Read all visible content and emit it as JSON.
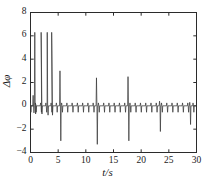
{
  "figure": {
    "background_color": "#ffffff",
    "line_color": "#3a3a3a",
    "axis_color": "#2b2b2b"
  },
  "axes": {
    "x_label": "t/s",
    "y_label": "Δφ",
    "x_ticks": [
      "0",
      "5",
      "10",
      "15",
      "20",
      "25",
      "30"
    ],
    "y_ticks": [
      "8",
      "6",
      "4",
      "2",
      "0",
      "−2",
      "−4"
    ]
  },
  "chart_data": {
    "type": "line",
    "title": "",
    "xlabel": "t/s",
    "ylabel": "Δφ",
    "xlim": [
      0,
      30
    ],
    "ylim": [
      -4,
      8
    ],
    "x_ticks": [
      0,
      5,
      10,
      15,
      20,
      25,
      30
    ],
    "y_ticks": [
      8,
      6,
      4,
      2,
      0,
      -2,
      -4
    ],
    "grid": false,
    "legend": "none",
    "series": [
      {
        "name": "phase difference",
        "description": "Near-zero baseline with periodic narrow downward spikes (~0.95 s period) and a set of large isolated transients.",
        "baseline_value": 0.0,
        "baseline_spike_period": 0.95,
        "baseline_spike_depth": -0.55,
        "baseline_spike_rise": 0.25,
        "transients": [
          {
            "t": 0.55,
            "up": 0.9,
            "down": -0.6
          },
          {
            "t": 0.85,
            "up": 6.3,
            "down": -0.7
          },
          {
            "t": 2.0,
            "up": 6.3,
            "down": -0.7
          },
          {
            "t": 3.1,
            "up": 6.3,
            "down": -0.8
          },
          {
            "t": 3.9,
            "up": 6.3,
            "down": -0.8
          },
          {
            "t": 5.4,
            "up": 3.0,
            "down": -3.0
          },
          {
            "t": 12.0,
            "up": 2.4,
            "down": -3.3
          },
          {
            "t": 17.7,
            "up": 2.5,
            "down": -3.0
          },
          {
            "t": 23.4,
            "up": 0.4,
            "down": -2.2
          },
          {
            "t": 28.85,
            "up": 0.3,
            "down": -1.6
          }
        ]
      }
    ]
  }
}
